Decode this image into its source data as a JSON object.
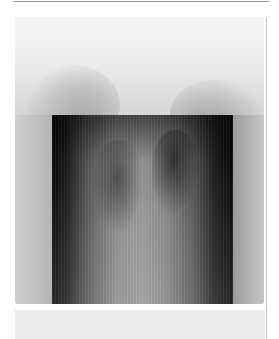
{
  "image": {
    "subject": "chest radiograph",
    "description": "Frontal chest X-ray with collimated dark rectangular field over the thorax, shoulders visible above",
    "colors": {
      "background": "#ffffff",
      "film_light": "#eaeaea",
      "film_mid": "#c9c9c9",
      "collimation_dark": "#0a0a0a",
      "border_line": "#9a9a9a"
    }
  }
}
